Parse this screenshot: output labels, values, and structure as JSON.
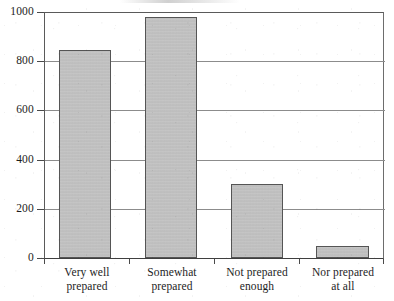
{
  "chart_data": {
    "type": "bar",
    "title": "",
    "subtitle": "",
    "xlabel": "",
    "ylabel": "",
    "categories": [
      "Very well prepared",
      "Somewhat prepared",
      "Not prepared enough",
      "Nor prepared at all"
    ],
    "category_lines": [
      [
        "Very well",
        "prepared"
      ],
      [
        "Somewhat",
        "prepared"
      ],
      [
        "Not prepared",
        "enough"
      ],
      [
        "Nor prepared",
        "at all"
      ]
    ],
    "values": [
      850,
      985,
      300,
      50
    ],
    "ylim": [
      0,
      1000
    ],
    "ytick_values": [
      0,
      200,
      400,
      600,
      800,
      1000
    ],
    "ytick_labels": [
      "0",
      "200",
      "400",
      "600",
      "800",
      "1000"
    ],
    "grid": true,
    "grid_axis": "y",
    "legend": false,
    "legend_position": "none",
    "bar_fill_color": "#c2c2c2",
    "bar_edge_color": "#555555",
    "gridline_color": "#8c8c8c",
    "axis_color": "#3f3f3f",
    "background_color": "#ffffff"
  }
}
